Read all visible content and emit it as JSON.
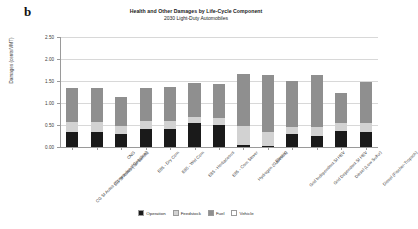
{
  "panel": {
    "label": "b"
  },
  "header": {
    "title": "Health and Other Damages by Life-Cycle Component",
    "subtitle": "2030 Light-Duty Automobiles"
  },
  "axes": {
    "ylabel": "Damages (cents/VMT)",
    "yticks": [
      "0.00",
      "0.50",
      "1.00",
      "1.50",
      "2.00",
      "2.50"
    ]
  },
  "legend": {
    "position": "bottom-center",
    "items": [
      {
        "label": "Operation",
        "color": "#1a1a1a"
      },
      {
        "label": "Feedstock",
        "color": "#d2d2d2"
      },
      {
        "label": "Fuel",
        "color": "#8f8f8f"
      },
      {
        "label": "Vehicle",
        "color": "#ffffff"
      }
    ]
  },
  "chart_data": {
    "type": "bar",
    "stacked": true,
    "title": "Health and Other Damages by Life-Cycle Component",
    "subtitle": "2030 Light-Duty Automobiles",
    "xlabel": "",
    "ylabel": "Damages (cents/VMT)",
    "ylim": [
      0.0,
      2.5
    ],
    "ytick_step": 0.5,
    "grid": true,
    "categories": [
      "CG SI Autos (Conventional Gasoline)",
      "CG SI Autos (Tar Sands)",
      "CNG",
      "E85 - Dry Corn",
      "E85 - Wet Corn",
      "E85 - Herbaceous",
      "E85 - Corn Stover",
      "Hydrogen (Gaseous)",
      "Electric",
      "Grid Independent SI HEV",
      "Grid Dependent SI HEV",
      "Diesel (Low Sulfur)",
      "Diesel (Fischer-Tropsch)"
    ],
    "series": [
      {
        "name": "Operation",
        "color": "#1a1a1a",
        "values": [
          0.34,
          0.34,
          0.3,
          0.41,
          0.41,
          0.55,
          0.5,
          0.05,
          0.02,
          0.3,
          0.25,
          0.36,
          0.34
        ]
      },
      {
        "name": "Feedstock",
        "color": "#d2d2d2",
        "values": [
          0.23,
          0.23,
          0.18,
          0.18,
          0.18,
          0.14,
          0.16,
          0.43,
          0.32,
          0.16,
          0.2,
          0.18,
          0.21
        ]
      },
      {
        "name": "Fuel",
        "color": "#8f8f8f",
        "values": [
          0.77,
          0.77,
          0.66,
          0.75,
          0.78,
          0.77,
          0.77,
          1.18,
          1.3,
          1.05,
          1.18,
          0.68,
          0.93
        ]
      },
      {
        "name": "Vehicle",
        "color": "#ffffff",
        "values": [
          0.0,
          0.0,
          0.0,
          0.0,
          0.0,
          0.0,
          0.0,
          0.0,
          0.0,
          0.0,
          0.0,
          0.0,
          0.0
        ]
      }
    ],
    "totals": [
      1.34,
      1.34,
      1.14,
      1.34,
      1.37,
      1.46,
      1.43,
      1.66,
      1.64,
      1.51,
      1.63,
      1.22,
      1.48
    ]
  }
}
